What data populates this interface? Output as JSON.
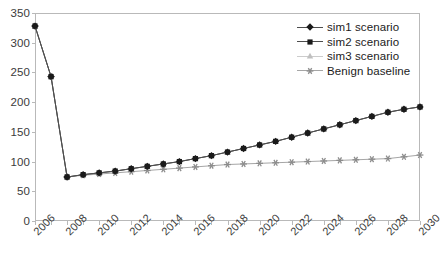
{
  "chart_data": {
    "type": "line",
    "title": "",
    "xlabel": "",
    "ylabel": "",
    "xlim": [
      2006,
      2030
    ],
    "ylim": [
      0,
      350
    ],
    "ytick_step": 50,
    "xtick_step": 2,
    "grid": false,
    "legend_position": "top-right",
    "yticks": [
      "0",
      "50",
      "100",
      "150",
      "200",
      "250",
      "300",
      "350"
    ],
    "xticks": [
      "2006",
      "2008",
      "2010",
      "2012",
      "2014",
      "2016",
      "2018",
      "2020",
      "2022",
      "2024",
      "2026",
      "2028",
      "2030"
    ],
    "x": [
      2006,
      2007,
      2008,
      2009,
      2010,
      2011,
      2012,
      2013,
      2014,
      2015,
      2016,
      2017,
      2018,
      2019,
      2020,
      2021,
      2022,
      2023,
      2024,
      2025,
      2026,
      2027,
      2028,
      2029,
      2030
    ],
    "series": [
      {
        "name": "sim1 scenario",
        "marker": "diamond",
        "color": "#1a1a1a",
        "line_color": "#4d4d4d",
        "values": [
          328,
          243,
          74,
          78,
          81,
          84,
          88,
          92,
          96,
          100,
          105,
          110,
          116,
          122,
          128,
          134,
          141,
          148,
          155,
          162,
          169,
          176,
          183,
          188,
          192
        ]
      },
      {
        "name": "sim2 scenario",
        "marker": "square",
        "color": "#1a1a1a",
        "line_color": "#4d4d4d",
        "values": [
          328,
          243,
          74,
          78,
          81,
          84,
          88,
          92,
          96,
          100,
          105,
          110,
          116,
          122,
          128,
          134,
          141,
          148,
          155,
          162,
          169,
          176,
          183,
          188,
          192
        ]
      },
      {
        "name": "sim3 scenario",
        "marker": "triangle",
        "color": "#bfbfbf",
        "line_color": "#cccccc",
        "values": [
          328,
          243,
          74,
          78,
          81,
          84,
          88,
          92,
          96,
          100,
          105,
          110,
          116,
          122,
          128,
          134,
          141,
          148,
          155,
          162,
          169,
          176,
          183,
          188,
          192
        ]
      },
      {
        "name": "Benign baseline",
        "marker": "asterisk",
        "color": "#8c8c8c",
        "line_color": "#a6a6a6",
        "values": [
          328,
          243,
          74,
          77,
          79,
          81,
          83,
          85,
          87,
          89,
          91,
          93,
          95,
          96,
          97,
          98,
          99,
          100,
          101,
          102,
          103,
          104,
          105,
          108,
          111
        ]
      }
    ]
  },
  "legend": {
    "items": [
      {
        "label": "sim1 scenario"
      },
      {
        "label": "sim2 scenario"
      },
      {
        "label": "sim3 scenario"
      },
      {
        "label": "Benign baseline"
      }
    ]
  }
}
